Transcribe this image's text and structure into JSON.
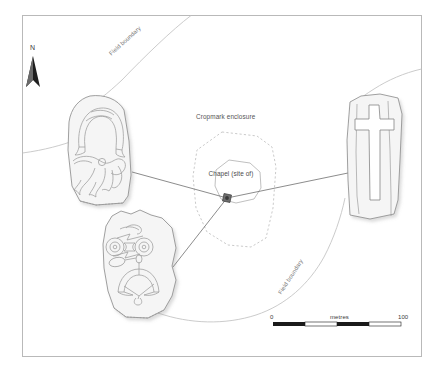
{
  "figure": {
    "type": "archaeological-site-plan",
    "frame": {
      "x": 22,
      "y": 15,
      "width": 400,
      "height": 342
    }
  },
  "north_arrow": {
    "label": "N"
  },
  "labels": {
    "cropmark_enclosure": "Cropmark enclosure",
    "chapel": "Chapel (site of)",
    "field_boundary_upper": "Field boundary",
    "field_boundary_lower": "Field boundary"
  },
  "scale_bar": {
    "min": "0",
    "max": "100",
    "unit": "metres",
    "segments": 4
  },
  "stones": [
    {
      "id": "stone-upper-left",
      "name": "pictish-symbol-stone-arch-and-beast",
      "symbols": [
        "arch",
        "beast"
      ]
    },
    {
      "id": "stone-lower-left",
      "name": "pictish-symbol-stone-double-disc-and-crescent",
      "symbols": [
        "double-disc-and-z-rod",
        "crescent-and-v-rod",
        "mirror"
      ]
    },
    {
      "id": "stone-right",
      "name": "cross-slab",
      "symbols": [
        "latin-cross"
      ]
    }
  ],
  "colors": {
    "frame": "#b8b8b8",
    "stone_fill": "#f5f5f5",
    "stone_stroke": "#8c8c8c",
    "carving_stroke": "#9a9a9a",
    "enclosure_dash": "#b0b0b0",
    "leader_line": "#6d6d6d",
    "field_boundary": "#bdbdbd",
    "marker": "#4a4a4a",
    "text": "#555555",
    "scale_dark": "#1a1a1a"
  }
}
